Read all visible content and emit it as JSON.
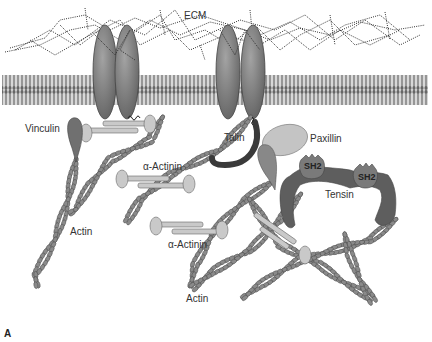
{
  "figure": {
    "panel_label": "A",
    "colors": {
      "membrane": "#6e6e6e",
      "integrin": "#7f7f7f",
      "actin": "#8a8a8a",
      "actinin": "#c9c9c9",
      "vinculin": "#707070",
      "talin": "#3a3a3a",
      "paxillin": "#c4c4c4",
      "tensin": "#5e5e5e",
      "ecm": "#333333"
    },
    "labels": {
      "ecm": "ECM",
      "vinculin": "Vinculin",
      "talin": "Talin",
      "paxillin": "Paxillin",
      "alpha_actinin_1": "α-Actinin",
      "alpha_actinin_2": "α-Actinin",
      "actin_1": "Actin",
      "actin_2": "Actin",
      "tensin": "Tensin",
      "sh2_1": "SH2",
      "sh2_2": "SH2"
    }
  }
}
